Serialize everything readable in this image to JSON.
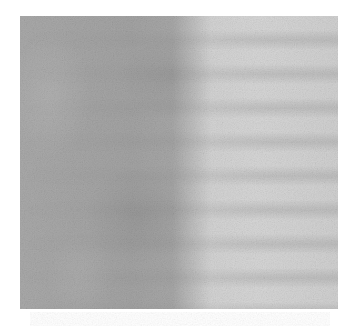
{
  "image": {
    "kind": "grayscale texture",
    "description": "Noisy grayscale micrograph-like texture: darker left half, lighter right half with faint horizontal banding",
    "panel": {
      "x": 20,
      "y": 16,
      "width": 318,
      "height": 293
    },
    "colors": {
      "background": "#ffffff",
      "dark_region": "#a6a6a6",
      "light_region": "#d6d6d6",
      "band_tone": "#5a5a5a"
    }
  }
}
